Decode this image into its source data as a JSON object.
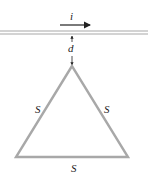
{
  "diagram": {
    "wire": {
      "current_label": "i",
      "color": "#a8a8a8"
    },
    "gap": {
      "label": "d"
    },
    "triangle": {
      "side_labels": [
        "S",
        "S",
        "S"
      ],
      "color": "#a8a8a8"
    }
  }
}
